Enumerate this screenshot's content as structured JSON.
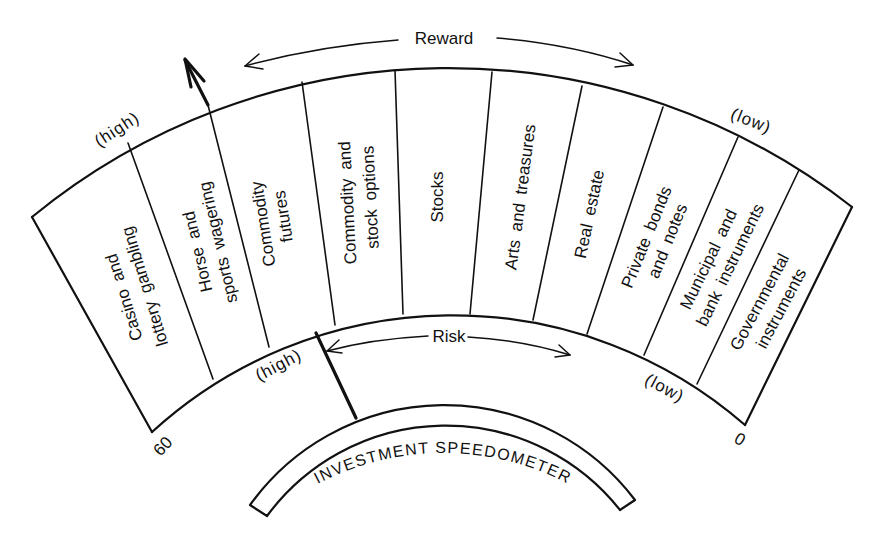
{
  "title": "INVESTMENT SPEEDOMETER",
  "reward": {
    "label": "Reward",
    "high": "(high)",
    "low": "(low)"
  },
  "risk": {
    "label": "Risk",
    "high": "(high)",
    "low": "(low)"
  },
  "scale": {
    "max": "60",
    "min": "0"
  },
  "categories": [
    {
      "name": "Casino and lottery gambling",
      "lines": [
        "Casino and",
        "lottery gambling"
      ]
    },
    {
      "name": "Horse and sports wagering",
      "lines": [
        "Horse and",
        "sports wagering"
      ]
    },
    {
      "name": "Commodity futures",
      "lines": [
        "Commodity",
        "futures"
      ]
    },
    {
      "name": "Commodity and stock options",
      "lines": [
        "Commodity and",
        "stock options"
      ]
    },
    {
      "name": "Stocks",
      "lines": [
        "Stocks"
      ]
    },
    {
      "name": "Arts and treasures",
      "lines": [
        "Arts and treasures"
      ]
    },
    {
      "name": "Real estate",
      "lines": [
        "Real estate"
      ]
    },
    {
      "name": "Private bonds and notes",
      "lines": [
        "Private bonds",
        "and notes"
      ]
    },
    {
      "name": "Municipal and bank instruments",
      "lines": [
        "Municipal and",
        "bank instruments"
      ]
    },
    {
      "name": "Governmental instruments",
      "lines": [
        "Governmental",
        "instruments"
      ]
    }
  ],
  "colors": {
    "ink": "#111111",
    "background": "#ffffff"
  }
}
